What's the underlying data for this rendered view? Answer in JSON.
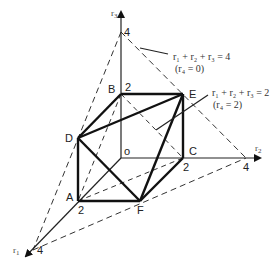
{
  "diagram": {
    "axes": {
      "r1": {
        "label": "r",
        "sub": "1",
        "tick_2": "2",
        "tick_4": "4"
      },
      "r2": {
        "label": "r",
        "sub": "2",
        "tick_2": "2",
        "tick_4": "4"
      },
      "r3": {
        "label": "r",
        "sub": "3",
        "tick_2": "2",
        "tick_4": "4"
      },
      "origin": "o"
    },
    "vertices": {
      "A": "A",
      "B": "B",
      "C": "C",
      "D": "D",
      "E": "E",
      "F": "F"
    },
    "annotations": {
      "plane4": {
        "equation": "r₁ + r₂ + r₃ = 4",
        "note": "(r₄ = 0)"
      },
      "plane2": {
        "equation": "r₁ + r₂ + r₃ = 2",
        "note": "(r₄ = 2)"
      }
    },
    "colors": {
      "line": "#1a1a1a",
      "dash": "#333333",
      "thin": "#555555"
    }
  }
}
